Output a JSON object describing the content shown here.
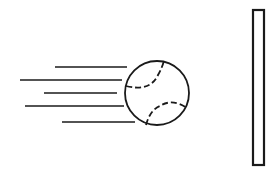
{
  "diagram": {
    "colors": {
      "stroke": "#1a1a1a",
      "background": "#ffffff"
    },
    "ball": {
      "cx": 157,
      "cy": 93,
      "r": 32
    },
    "speed_lines": [
      {
        "x1": 55,
        "x2": 127,
        "y": 67
      },
      {
        "x1": 20,
        "x2": 122,
        "y": 80
      },
      {
        "x1": 44,
        "x2": 117,
        "y": 93
      },
      {
        "x1": 25,
        "x2": 124,
        "y": 106
      },
      {
        "x1": 62,
        "x2": 135,
        "y": 122
      }
    ],
    "wall": {
      "x": 253,
      "y": 10,
      "width": 11,
      "height": 155
    }
  }
}
